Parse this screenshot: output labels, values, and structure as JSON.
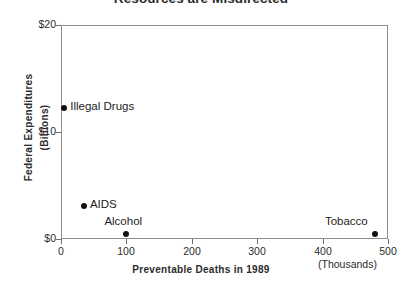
{
  "chart_data": {
    "type": "scatter",
    "title": "Resources are Misdirected",
    "xlabel": "Preventable Deaths in 1989",
    "xunits": "(Thousands)",
    "ylabel": "Federal Expenditures",
    "yunits": "(Billions)",
    "xlim": [
      0,
      500
    ],
    "ylim": [
      0,
      20
    ],
    "grid": false,
    "legend": "none",
    "xticks": [
      {
        "value": 0,
        "label": "0"
      },
      {
        "value": 100,
        "label": "100"
      },
      {
        "value": 200,
        "label": "200"
      },
      {
        "value": 300,
        "label": "300"
      },
      {
        "value": 400,
        "label": "400"
      },
      {
        "value": 500,
        "label": "500"
      }
    ],
    "yticks": [
      {
        "value": 0,
        "label": "$0"
      },
      {
        "value": 10,
        "label": "$10"
      },
      {
        "value": 20,
        "label": "$20"
      }
    ],
    "points": [
      {
        "label": "Illegal Drugs",
        "x": 5,
        "y": 12.2,
        "label_pos": "right"
      },
      {
        "label": "AIDS",
        "x": 35,
        "y": 3.1,
        "label_pos": "right"
      },
      {
        "label": "Alcohol",
        "x": 100,
        "y": 0.5,
        "label_pos": "above"
      },
      {
        "label": "Tobacco",
        "x": 480,
        "y": 0.5,
        "label_pos": "above-left"
      }
    ]
  }
}
